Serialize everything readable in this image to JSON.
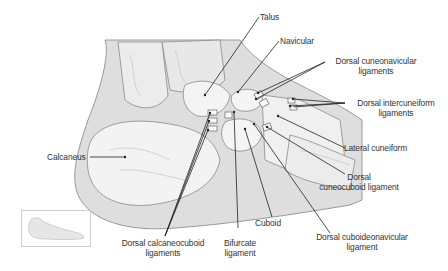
{
  "figure": {
    "colors": {
      "line": "#222222",
      "bone": "#f2f2f2",
      "soft_tissue": "#d9d9d9",
      "outline": "#9a9a9a",
      "text": "#333333"
    }
  },
  "labels": {
    "talus": "Talus",
    "navicular": "Navicular",
    "dorsal_cuneonavicular": [
      "Dorsal cuneonavicular",
      "ligaments"
    ],
    "dorsal_intercuneiform": [
      "Dorsal intercuneiform",
      "ligaments"
    ],
    "lateral_cuneiform": "Lateral cuneiform",
    "dorsal_cuneocuboid": [
      "Dorsal",
      "cuneocuboid ligament"
    ],
    "calcaneus": "Calcaneus",
    "cuboid": "Cuboid",
    "dorsal_cuboideonavicular": [
      "Dorsal cuboideonavicular",
      "ligament"
    ],
    "dorsal_calcaneocuboid": [
      "Dorsal calcaneocuboid",
      "ligaments"
    ],
    "bifurcate": [
      "Bifurcate",
      "ligament"
    ]
  },
  "thumbnail": {
    "name": "foot-orientation-thumbnail"
  }
}
